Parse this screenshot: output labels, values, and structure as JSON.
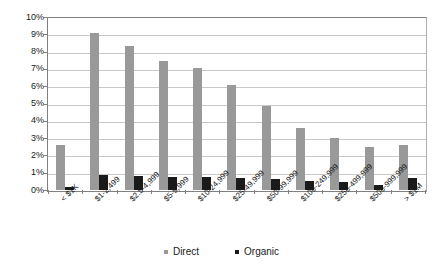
{
  "chart_data": {
    "type": "bar",
    "title": "",
    "subtitle": "",
    "xlabel": "",
    "ylabel": "",
    "ylim": [
      0,
      10
    ],
    "ytick_labels": [
      "10%",
      "9%",
      "8%",
      "7%",
      "6%",
      "5%",
      "4%",
      "3%",
      "2%",
      "1%",
      "0%"
    ],
    "ytick_values": [
      10,
      9,
      8,
      7,
      6,
      5,
      4,
      3,
      2,
      1,
      0
    ],
    "grid": true,
    "legend_position": "bottom",
    "categories": [
      "< $1K",
      "$1-2,499",
      "$2.5-4,999",
      "$5-9,999",
      "$10-24,999",
      "$25-49,999",
      "$50-99,999",
      "$100-249,999",
      "$250-499,999",
      "$500-999,999",
      "> $1M"
    ],
    "series": [
      {
        "name": "Direct",
        "color": "#999999",
        "values": [
          2.6,
          9.1,
          8.4,
          7.5,
          7.1,
          6.1,
          4.9,
          3.6,
          3.0,
          2.5,
          2.6
        ]
      },
      {
        "name": "Organic",
        "color": "#1a1a1a",
        "values": [
          0.15,
          0.85,
          0.8,
          0.75,
          0.75,
          0.7,
          0.65,
          0.5,
          0.45,
          0.3,
          0.7
        ]
      }
    ]
  },
  "legend": {
    "items": [
      {
        "label": "Direct"
      },
      {
        "label": "Organic"
      }
    ]
  },
  "colors": {
    "direct": "#999999",
    "organic": "#1a1a1a",
    "gridline": "#c8c8c8",
    "axis": "#808080",
    "background": "#ffffff"
  }
}
